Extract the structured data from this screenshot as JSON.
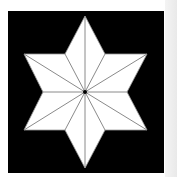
{
  "figure": {
    "colors": {
      "background": "#ffffff",
      "frame": "#000000",
      "star_fill": "#ffffff",
      "fold_lines": "#8a8a8a",
      "center_dot": "#000000"
    },
    "center": [
      85,
      92
    ],
    "outer_points": [
      [
        85,
        16
      ],
      [
        147,
        54
      ],
      [
        147,
        130
      ],
      [
        85,
        168
      ],
      [
        24,
        130
      ],
      [
        24,
        54
      ]
    ],
    "inner_points": [
      [
        105,
        54
      ],
      [
        127,
        92
      ],
      [
        105,
        130
      ],
      [
        65,
        130
      ],
      [
        43,
        92
      ],
      [
        65,
        54
      ]
    ]
  }
}
